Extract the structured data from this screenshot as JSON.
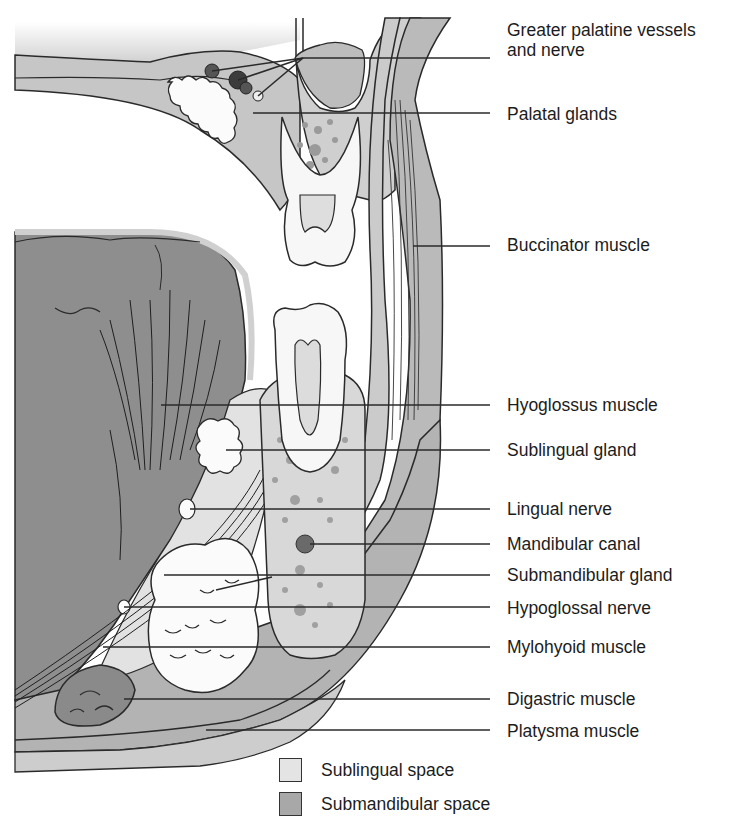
{
  "figure": {
    "colors": {
      "sublingual_space": "#e2e2e2",
      "submandibular_space": "#a9a9a9",
      "tongue": "#8e8e8e",
      "soft_tissue": "#c4c4c4",
      "bone": "#d6d6d6",
      "tooth": "#f7f7f7",
      "line": "#2a2a2a"
    }
  },
  "labels": [
    {
      "id": "greater-palatine",
      "line1": "Greater palatine vessels",
      "line2": "and nerve",
      "top": 20,
      "leader_y": 58,
      "leader_x": 303
    },
    {
      "id": "palatal-glands",
      "line1": "Palatal glands",
      "line2": "",
      "top": 104,
      "leader_y": 113,
      "leader_x": 253
    },
    {
      "id": "buccinator",
      "line1": "Buccinator muscle",
      "line2": "",
      "top": 235,
      "leader_y": 246,
      "leader_x": 413
    },
    {
      "id": "hyoglossus",
      "line1": "Hyoglossus muscle",
      "line2": "",
      "top": 395,
      "leader_y": 405,
      "leader_x": 161
    },
    {
      "id": "sublingual-gland",
      "line1": "Sublingual gland",
      "line2": "",
      "top": 440,
      "leader_y": 450,
      "leader_x": 226
    },
    {
      "id": "lingual-nerve",
      "line1": "Lingual nerve",
      "line2": "",
      "top": 500,
      "leader_y": 509,
      "leader_x": 190
    },
    {
      "id": "mandibular-canal",
      "line1": "Mandibular canal",
      "line2": "",
      "top": 535,
      "leader_y": 544,
      "leader_x": 310
    },
    {
      "id": "submandibular-gland",
      "line1": "Submandibular gland",
      "line2": "",
      "top": 566,
      "leader_y": 575,
      "leader_x": 164
    },
    {
      "id": "hypoglossal-nerve",
      "line1": "Hypoglossal nerve",
      "line2": "",
      "top": 599,
      "leader_y": 607,
      "leader_x": 124
    },
    {
      "id": "mylohyoid",
      "line1": "Mylohyoid muscle",
      "line2": "",
      "top": 638,
      "leader_y": 647,
      "leader_x": 103
    },
    {
      "id": "digastric",
      "line1": "Digastric muscle",
      "line2": "",
      "top": 690,
      "leader_y": 699,
      "leader_x": 124
    },
    {
      "id": "platysma",
      "line1": "Platysma muscle",
      "line2": "",
      "top": 722,
      "leader_y": 730,
      "leader_x": 206
    }
  ],
  "legend": [
    {
      "label": "Sublingual space",
      "color": "#e4e4e4",
      "top": 758
    },
    {
      "label": "Submandibular space",
      "color": "#a8a8a8",
      "top": 792
    }
  ]
}
